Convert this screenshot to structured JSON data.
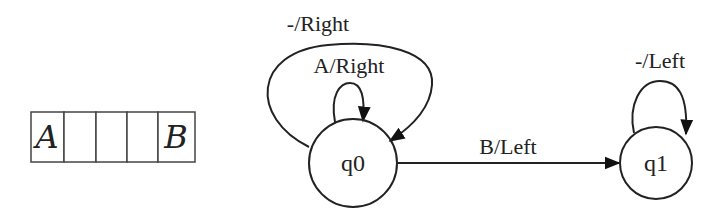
{
  "tape": {
    "cells": [
      "A",
      "",
      "",
      "",
      "B"
    ]
  },
  "states": [
    {
      "id": "q0",
      "label": "q0"
    },
    {
      "id": "q1",
      "label": "q1"
    }
  ],
  "transitions": {
    "q0_outer_loop": "-/Right",
    "q0_inner_loop": "A/Right",
    "q0_to_q1": "B/Left",
    "q1_loop": "-/Left"
  },
  "colors": {
    "stroke": "#222222",
    "background": "#ffffff"
  }
}
